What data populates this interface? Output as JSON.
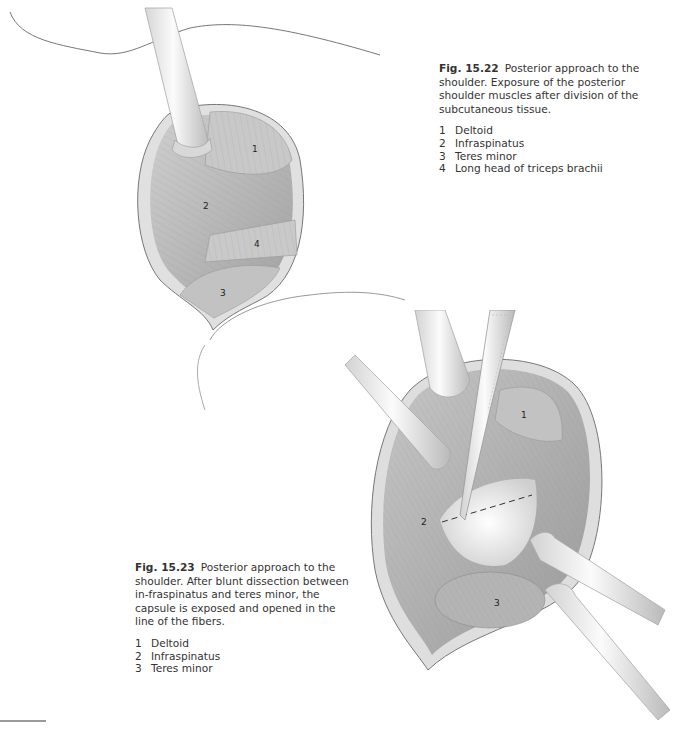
{
  "figures": [
    {
      "id": "fig-15-22",
      "number": "Fig. 15.22",
      "caption": "Posterior approach to the shoulder. Exposure of the posterior shoulder muscles after division of the subcutaneous tissue.",
      "legend": [
        {
          "num": "1",
          "text": "Deltoid"
        },
        {
          "num": "2",
          "text": "Infraspinatus"
        },
        {
          "num": "3",
          "text": "Teres minor"
        },
        {
          "num": "4",
          "text": "Long head of triceps brachii"
        }
      ],
      "labels": [
        "1",
        "2",
        "4",
        "3"
      ]
    },
    {
      "id": "fig-15-23",
      "number": "Fig. 15.23",
      "caption": "Posterior approach to the shoulder. After blunt dissection between in-fraspinatus and teres minor, the capsule is exposed and opened in the line of the fibers.",
      "legend": [
        {
          "num": "1",
          "text": "Deltoid"
        },
        {
          "num": "2",
          "text": "Infraspinatus"
        },
        {
          "num": "3",
          "text": "Teres minor"
        }
      ],
      "labels": [
        "1",
        "2",
        "3"
      ]
    }
  ],
  "colors": {
    "muscle": "#bdbdbd",
    "muscle_dark": "#9c9c9c",
    "skin_edge": "#d9d9d9",
    "instrument": "#eeeeee",
    "outline": "#6e6e6e"
  }
}
